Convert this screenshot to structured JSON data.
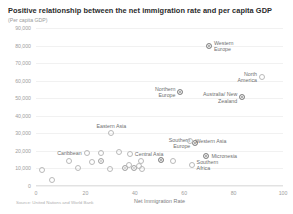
{
  "chart_data": {
    "type": "scatter",
    "title": "Positive relationship between the net immigration rate and per capita GDP",
    "subtitle": "(Per capita GDP)",
    "source": "Source: United Nations and World Bank",
    "xlabel": "Net Immigration Rate",
    "ylabel": "",
    "xlim": [
      0,
      100
    ],
    "ylim": [
      0,
      90000
    ],
    "xticks": [
      "0",
      "20",
      "40",
      "60",
      "80",
      "100"
    ],
    "xtick_values": [
      0,
      20,
      40,
      60,
      80,
      100
    ],
    "yticks": [
      "0",
      "10,000",
      "20,000",
      "30,000",
      "40,000",
      "50,000",
      "60,000",
      "70,000",
      "80,000",
      "90,000"
    ],
    "ytick_values": [
      0,
      10000,
      20000,
      30000,
      40000,
      50000,
      60000,
      70000,
      80000,
      90000
    ],
    "grid": true,
    "legend": "none",
    "marker_color": "#b9b9b9",
    "marker_fill_color": "#8c8c8c",
    "points": [
      {
        "label": "Western Europe",
        "x": 70,
        "y": 80000,
        "style": "filled",
        "label_pos": "right"
      },
      {
        "label": "North America",
        "x": 91.5,
        "y": 62000,
        "style": "open",
        "label_pos": "left"
      },
      {
        "label": "Northern Europe",
        "x": 58.5,
        "y": 53500,
        "style": "filled",
        "label_pos": "left"
      },
      {
        "label": "Australia/ New Zealand",
        "x": 83.5,
        "y": 50500,
        "style": "filled",
        "label_pos": "left"
      },
      {
        "label": "Eastern Asia",
        "x": 30.5,
        "y": 30000,
        "style": "open",
        "label_pos": "above"
      },
      {
        "label": "Southern Europe",
        "x": 64.5,
        "y": 24500,
        "style": "filled",
        "label_pos": "left"
      },
      {
        "label": "Western Asia",
        "x": 62.5,
        "y": 25800,
        "style": "open",
        "label_pos": "right"
      },
      {
        "label": "Central Asia",
        "x": 38,
        "y": 18500,
        "style": "open",
        "label_pos": "right"
      },
      {
        "label": "Micronesia",
        "x": 69,
        "y": 17200,
        "style": "filled",
        "label_pos": "right"
      },
      {
        "label": "Southern Africa",
        "x": 63,
        "y": 12000,
        "style": "open",
        "label_pos": "right"
      },
      {
        "label": "Caribbean",
        "x": 20.5,
        "y": 19000,
        "style": "open",
        "label_pos": "left"
      },
      {
        "label": "",
        "x": 26.5,
        "y": 19000,
        "style": "open",
        "label_pos": "right"
      },
      {
        "label": "",
        "x": 33.5,
        "y": 19500,
        "style": "open",
        "label_pos": "right"
      },
      {
        "label": "",
        "x": 13.5,
        "y": 14500,
        "style": "open",
        "label_pos": "right"
      },
      {
        "label": "",
        "x": 22.5,
        "y": 13500,
        "style": "open",
        "label_pos": "right"
      },
      {
        "label": "",
        "x": 26.5,
        "y": 14000,
        "style": "mid",
        "label_pos": "right"
      },
      {
        "label": "",
        "x": 42.5,
        "y": 14200,
        "style": "open",
        "label_pos": "right"
      },
      {
        "label": "",
        "x": 50.5,
        "y": 15000,
        "style": "filled",
        "label_pos": "right"
      },
      {
        "label": "",
        "x": 55.5,
        "y": 14500,
        "style": "open",
        "label_pos": "right"
      },
      {
        "label": "",
        "x": 2.5,
        "y": 9000,
        "style": "open",
        "label_pos": "right"
      },
      {
        "label": "",
        "x": 17,
        "y": 10500,
        "style": "open",
        "label_pos": "right"
      },
      {
        "label": "",
        "x": 30,
        "y": 9800,
        "style": "open",
        "label_pos": "right"
      },
      {
        "label": "",
        "x": 36,
        "y": 10200,
        "style": "mid",
        "label_pos": "right"
      },
      {
        "label": "",
        "x": 37.5,
        "y": 11800,
        "style": "open",
        "label_pos": "right"
      },
      {
        "label": "",
        "x": 39.5,
        "y": 10000,
        "style": "mid",
        "label_pos": "right"
      },
      {
        "label": "",
        "x": 41.5,
        "y": 11200,
        "style": "open",
        "label_pos": "right"
      },
      {
        "label": "",
        "x": 43,
        "y": 9600,
        "style": "open",
        "label_pos": "right"
      },
      {
        "label": "",
        "x": 6.5,
        "y": 3500,
        "style": "open",
        "label_pos": "right"
      }
    ]
  }
}
